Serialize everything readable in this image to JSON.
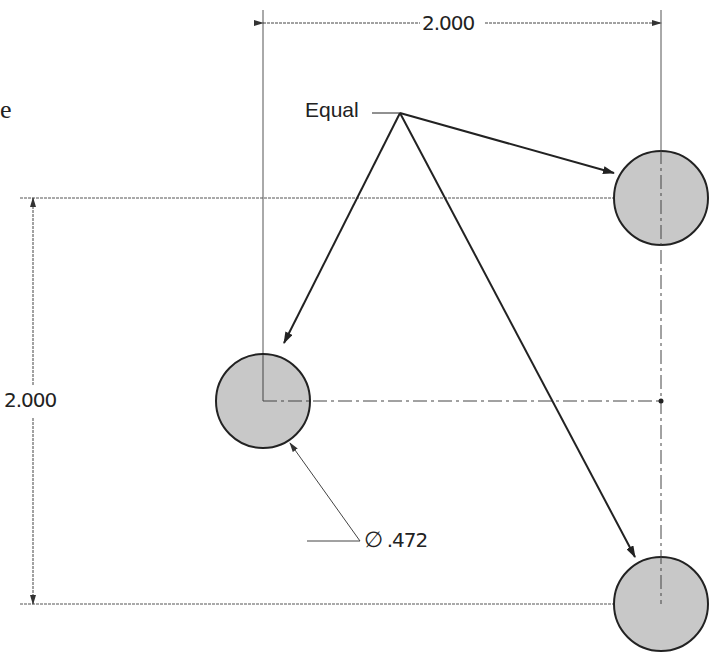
{
  "fragment_text": "e",
  "dimensions": {
    "horizontal": "2.000",
    "vertical": "2.000",
    "diameter_symbol": "∅",
    "diameter_value": ".472"
  },
  "annotation": {
    "equal_label": "Equal"
  },
  "holes": [
    {
      "name": "top-right",
      "cx": 661,
      "cy": 198,
      "r": 47
    },
    {
      "name": "middle-left",
      "cx": 263,
      "cy": 401,
      "r": 47
    },
    {
      "name": "bottom-right",
      "cx": 661,
      "cy": 604,
      "r": 47
    }
  ],
  "colors": {
    "hole_fill": "#c8c8c8",
    "line": "#222222",
    "thin_line": "#555555"
  }
}
